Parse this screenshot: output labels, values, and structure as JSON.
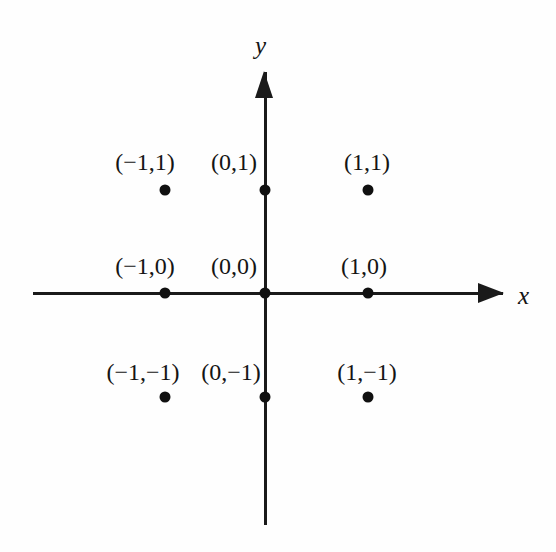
{
  "figure": {
    "width": 556,
    "height": 552,
    "background_color": "#fefefe",
    "ink_color": "#141414"
  },
  "axes": {
    "x": {
      "name": "x",
      "origin_px": 265,
      "baseline_px": 293,
      "start_px": 33,
      "arrow_tip_px": 504,
      "label_x_px": 525,
      "label_y_px": 295
    },
    "y": {
      "name": "y",
      "origin_px": 293,
      "baseline_px": 265,
      "arrow_tip_px": 71,
      "end_px": 525,
      "label_x_px": 262,
      "label_y_px": 46
    }
  },
  "chart_data": {
    "type": "scatter",
    "title": "",
    "subtitle": "",
    "xlabel": "x",
    "ylabel": "y",
    "xlim": [
      -2.25,
      2.3
    ],
    "ylim": [
      -2.15,
      2.15
    ],
    "grid": false,
    "legend": null,
    "annotations": [],
    "axis_style": "arrows-both-ends",
    "series": [
      {
        "name": "lattice points",
        "marker": "filled-circle",
        "color": "#101010",
        "points": [
          {
            "id": "neg1-1",
            "x": -1,
            "y": 1,
            "label": "(−1,1)",
            "px": 165,
            "py": 190,
            "label_cx": 145,
            "label_top": 150
          },
          {
            "id": "0-1",
            "x": 0,
            "y": 1,
            "label": "(0,1)",
            "px": 265,
            "py": 190,
            "label_cx": 234,
            "label_top": 150
          },
          {
            "id": "1-1",
            "x": 1,
            "y": 1,
            "label": "(1,1)",
            "px": 368,
            "py": 190,
            "label_cx": 367,
            "label_top": 150
          },
          {
            "id": "neg1-0",
            "x": -1,
            "y": 0,
            "label": "(−1,0)",
            "px": 165,
            "py": 293,
            "label_cx": 145,
            "label_top": 254
          },
          {
            "id": "0-0",
            "x": 0,
            "y": 0,
            "label": "(0,0)",
            "px": 265,
            "py": 293,
            "label_cx": 234,
            "label_top": 254
          },
          {
            "id": "1-0",
            "x": 1,
            "y": 0,
            "label": "(1,0)",
            "px": 368,
            "py": 293,
            "label_cx": 364,
            "label_top": 254
          },
          {
            "id": "neg1-neg1",
            "x": -1,
            "y": -1,
            "label": "(−1,−1)",
            "px": 165,
            "py": 397,
            "label_cx": 143,
            "label_top": 360
          },
          {
            "id": "0-neg1",
            "x": 0,
            "y": -1,
            "label": "(0,−1)",
            "px": 265,
            "py": 397,
            "label_cx": 231,
            "label_top": 360
          },
          {
            "id": "1-neg1",
            "x": 1,
            "y": -1,
            "label": "(1,−1)",
            "px": 368,
            "py": 397,
            "label_cx": 367,
            "label_top": 360
          }
        ]
      }
    ]
  }
}
